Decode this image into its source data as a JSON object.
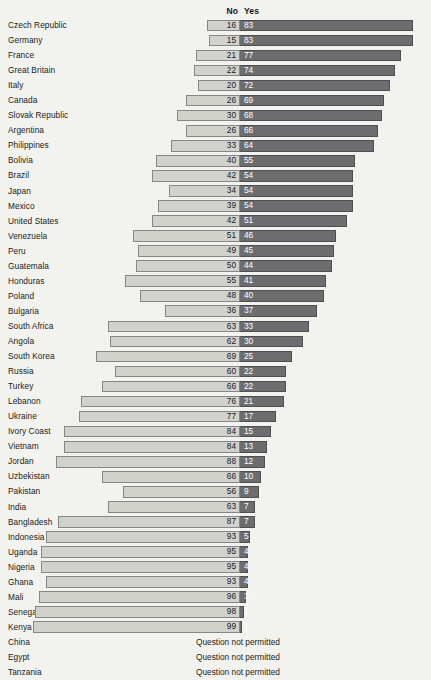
{
  "header": {
    "no_label": "No",
    "yes_label": "Yes"
  },
  "not_permitted_text": "Question not permitted",
  "colors": {
    "background": "#f2f2ee",
    "no_bar": "#d2d2cd",
    "no_bar_border": "#86868a",
    "yes_bar": "#6d6d70",
    "yes_bar_border": "#4f4f53",
    "label_text": "#1b1c20",
    "yes_value_text": "#ffffff"
  },
  "chart_data": {
    "type": "bar",
    "title": "",
    "subtitle": "",
    "xlabel": "",
    "ylabel": "",
    "orientation": "horizontal",
    "layout": "diverging-stacked",
    "zero_axis_x_px": 240,
    "units": "percent",
    "legend": [
      "No",
      "Yes"
    ],
    "legend_position": "top",
    "grid": false,
    "categories": [
      "Czech Republic",
      "Germany",
      "France",
      "Great Britain",
      "Italy",
      "Canada",
      "Slovak Republic",
      "Argentina",
      "Philippines",
      "Bolivia",
      "Brazil",
      "Japan",
      "Mexico",
      "United States",
      "Venezuela",
      "Peru",
      "Guatemala",
      "Honduras",
      "Poland",
      "Bulgaria",
      "South Africa",
      "Angola",
      "South Korea",
      "Russia",
      "Turkey",
      "Lebanon",
      "Ukraine",
      "Ivory Coast",
      "Vietnam",
      "Jordan",
      "Uzbekistan",
      "Pakistan",
      "India",
      "Bangladesh",
      "Indonesia",
      "Uganda",
      "Nigeria",
      "Ghana",
      "Mali",
      "Senegal",
      "Kenya",
      "China",
      "Egypt",
      "Tanzania"
    ],
    "series": [
      {
        "name": "No",
        "values": [
          16,
          15,
          21,
          22,
          20,
          26,
          30,
          26,
          33,
          40,
          42,
          34,
          39,
          42,
          51,
          49,
          50,
          55,
          48,
          36,
          63,
          62,
          69,
          60,
          66,
          76,
          77,
          84,
          84,
          88,
          66,
          56,
          63,
          87,
          93,
          95,
          95,
          93,
          96,
          98,
          99,
          null,
          null,
          null
        ]
      },
      {
        "name": "Yes",
        "values": [
          83,
          83,
          77,
          74,
          72,
          69,
          68,
          66,
          64,
          55,
          54,
          54,
          54,
          51,
          46,
          45,
          44,
          41,
          40,
          37,
          33,
          30,
          25,
          22,
          22,
          21,
          17,
          15,
          13,
          12,
          10,
          9,
          7,
          7,
          5,
          4,
          4,
          4,
          3,
          2,
          1,
          null,
          null,
          null
        ]
      }
    ],
    "rows": [
      {
        "country": "Czech Republic",
        "no": 16,
        "yes": 83,
        "permitted": true
      },
      {
        "country": "Germany",
        "no": 15,
        "yes": 83,
        "permitted": true
      },
      {
        "country": "France",
        "no": 21,
        "yes": 77,
        "permitted": true
      },
      {
        "country": "Great Britain",
        "no": 22,
        "yes": 74,
        "permitted": true
      },
      {
        "country": "Italy",
        "no": 20,
        "yes": 72,
        "permitted": true
      },
      {
        "country": "Canada",
        "no": 26,
        "yes": 69,
        "permitted": true
      },
      {
        "country": "Slovak Republic",
        "no": 30,
        "yes": 68,
        "permitted": true
      },
      {
        "country": "Argentina",
        "no": 26,
        "yes": 66,
        "permitted": true
      },
      {
        "country": "Philippines",
        "no": 33,
        "yes": 64,
        "permitted": true
      },
      {
        "country": "Bolivia",
        "no": 40,
        "yes": 55,
        "permitted": true
      },
      {
        "country": "Brazil",
        "no": 42,
        "yes": 54,
        "permitted": true
      },
      {
        "country": "Japan",
        "no": 34,
        "yes": 54,
        "permitted": true
      },
      {
        "country": "Mexico",
        "no": 39,
        "yes": 54,
        "permitted": true
      },
      {
        "country": "United States",
        "no": 42,
        "yes": 51,
        "permitted": true
      },
      {
        "country": "Venezuela",
        "no": 51,
        "yes": 46,
        "permitted": true
      },
      {
        "country": "Peru",
        "no": 49,
        "yes": 45,
        "permitted": true
      },
      {
        "country": "Guatemala",
        "no": 50,
        "yes": 44,
        "permitted": true
      },
      {
        "country": "Honduras",
        "no": 55,
        "yes": 41,
        "permitted": true
      },
      {
        "country": "Poland",
        "no": 48,
        "yes": 40,
        "permitted": true
      },
      {
        "country": "Bulgaria",
        "no": 36,
        "yes": 37,
        "permitted": true
      },
      {
        "country": "South Africa",
        "no": 63,
        "yes": 33,
        "permitted": true
      },
      {
        "country": "Angola",
        "no": 62,
        "yes": 30,
        "permitted": true
      },
      {
        "country": "South Korea",
        "no": 69,
        "yes": 25,
        "permitted": true
      },
      {
        "country": "Russia",
        "no": 60,
        "yes": 22,
        "permitted": true
      },
      {
        "country": "Turkey",
        "no": 66,
        "yes": 22,
        "permitted": true
      },
      {
        "country": "Lebanon",
        "no": 76,
        "yes": 21,
        "permitted": true
      },
      {
        "country": "Ukraine",
        "no": 77,
        "yes": 17,
        "permitted": true
      },
      {
        "country": "Ivory Coast",
        "no": 84,
        "yes": 15,
        "permitted": true
      },
      {
        "country": "Vietnam",
        "no": 84,
        "yes": 13,
        "permitted": true
      },
      {
        "country": "Jordan",
        "no": 88,
        "yes": 12,
        "permitted": true
      },
      {
        "country": "Uzbekistan",
        "no": 66,
        "yes": 10,
        "permitted": true
      },
      {
        "country": "Pakistan",
        "no": 56,
        "yes": 9,
        "permitted": true
      },
      {
        "country": "India",
        "no": 63,
        "yes": 7,
        "permitted": true
      },
      {
        "country": "Bangladesh",
        "no": 87,
        "yes": 7,
        "permitted": true
      },
      {
        "country": "Indonesia",
        "no": 93,
        "yes": 5,
        "permitted": true
      },
      {
        "country": "Uganda",
        "no": 95,
        "yes": 4,
        "permitted": true
      },
      {
        "country": "Nigeria",
        "no": 95,
        "yes": 4,
        "permitted": true
      },
      {
        "country": "Ghana",
        "no": 93,
        "yes": 4,
        "permitted": true
      },
      {
        "country": "Mali",
        "no": 96,
        "yes": 3,
        "permitted": true
      },
      {
        "country": "Senegal",
        "no": 98,
        "yes": 2,
        "permitted": true
      },
      {
        "country": "Kenya",
        "no": 99,
        "yes": 1,
        "permitted": true
      },
      {
        "country": "China",
        "no": null,
        "yes": null,
        "permitted": false
      },
      {
        "country": "Egypt",
        "no": null,
        "yes": null,
        "permitted": false
      },
      {
        "country": "Tanzania",
        "no": null,
        "yes": null,
        "permitted": false
      }
    ]
  }
}
